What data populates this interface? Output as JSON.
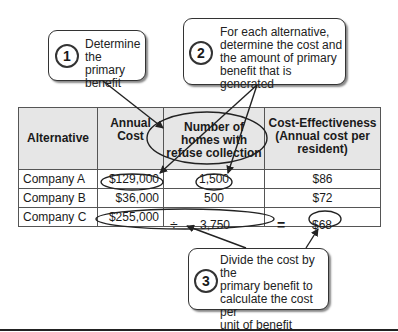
{
  "callouts": [
    {
      "number": "1",
      "lines": [
        "Determine",
        "the primary",
        "benefit"
      ]
    },
    {
      "number": "2",
      "lines": [
        "For each alternative,",
        "determine the cost and",
        "the amount of primary",
        "benefit that is generated"
      ]
    },
    {
      "number": "3",
      "lines": [
        "Divide the cost by the",
        "primary benefit to",
        "calculate the cost per",
        "unit of benefit"
      ]
    }
  ],
  "table": {
    "headers": [
      [
        "Alternative"
      ],
      [
        "Annual",
        "Cost"
      ],
      [
        "Number of",
        "homes with",
        "refuse collection"
      ],
      [
        "Cost-Effectiveness",
        "(Annual cost per",
        "resident)"
      ]
    ],
    "rows": [
      {
        "alternative": "Company A",
        "annual_cost": "$129,000",
        "operator": "",
        "homes": "1,500",
        "equals": "",
        "cost_effectiveness": "$86"
      },
      {
        "alternative": "Company B",
        "annual_cost": "$36,000",
        "operator": "",
        "homes": "500",
        "equals": "",
        "cost_effectiveness": "$72"
      },
      {
        "alternative": "Company C",
        "annual_cost": "$255,000",
        "operator": "÷",
        "homes": "3,750",
        "equals": "=",
        "cost_effectiveness": "$68"
      }
    ]
  }
}
